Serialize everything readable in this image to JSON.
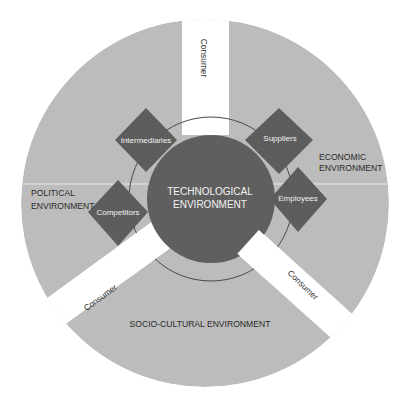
{
  "diagram": {
    "type": "marketing-environment-wheel",
    "colors": {
      "outer_ring": "#bcbcbc",
      "core": "#5f5f5f",
      "diamond": "#5d5d5d",
      "gap": "#ffffff",
      "ring_line": "#4a4a4a",
      "divider": "#e8e8e8"
    },
    "center": {
      "line1": "TECHNOLOGICAL",
      "line2": "ENVIRONMENT"
    },
    "outer_sectors": {
      "political": {
        "line1": "POLITICAL",
        "line2": "ENVIRONMENT"
      },
      "economic": {
        "line1": "ECONOMIC",
        "line2": "ENVIRONMENT"
      },
      "socio_cultural": {
        "label": "SOCIO-CULTURAL ENVIRONMENT"
      }
    },
    "consumer_gaps": [
      {
        "label": "Consumer",
        "position": "top"
      },
      {
        "label": "Consumer",
        "position": "bottom-left"
      },
      {
        "label": "Consumer",
        "position": "bottom-right"
      }
    ],
    "diamonds": [
      {
        "label": "Intermediaries"
      },
      {
        "label": "Suppliers"
      },
      {
        "label": "Competitors"
      },
      {
        "label": "Employees"
      }
    ]
  }
}
